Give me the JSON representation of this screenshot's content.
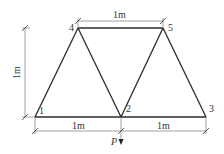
{
  "diagram": {
    "type": "truss",
    "nodes": [
      {
        "id": "1",
        "label": "1",
        "x": 35,
        "y": 117
      },
      {
        "id": "2",
        "label": "2",
        "x": 121,
        "y": 117
      },
      {
        "id": "3",
        "label": "3",
        "x": 206,
        "y": 117
      },
      {
        "id": "4",
        "label": "4",
        "x": 78,
        "y": 28
      },
      {
        "id": "5",
        "label": "5",
        "x": 163,
        "y": 28
      }
    ],
    "members": [
      [
        "1",
        "2"
      ],
      [
        "2",
        "3"
      ],
      [
        "4",
        "5"
      ],
      [
        "1",
        "4"
      ],
      [
        "4",
        "2"
      ],
      [
        "2",
        "5"
      ],
      [
        "5",
        "3"
      ]
    ],
    "dimensions": {
      "top": "1m",
      "left": "1m",
      "bottom_left": "1m",
      "bottom_right": "1m"
    },
    "load": {
      "label": "P",
      "node": "2",
      "direction": "down"
    }
  }
}
